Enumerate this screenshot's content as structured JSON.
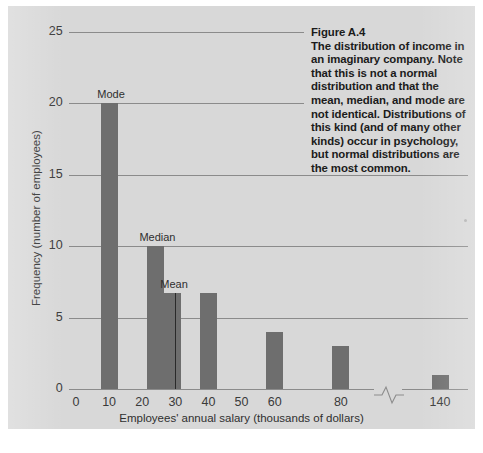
{
  "figure": {
    "caption_title": "Figure A.4",
    "caption_body": "The distribution of income in an imaginary company. Note that this is not a normal distribution and that the mean, median, and mode are not identical. Distributions of this kind (and of many other kinds) occur in psychology, but normal distributions are the most common."
  },
  "colors": {
    "panel_background": "#d8d8d8",
    "bar_fill": "#6e6e6e",
    "gridline": "#8b8b8b",
    "text": "#2f2f2f",
    "caption_text": "#1b1b1b"
  },
  "chart_data": {
    "type": "bar",
    "title": "",
    "xlabel": "Employees' annual salary (thousands of dollars)",
    "ylabel": "Frequency (number of employees)",
    "xlim": [
      0,
      150
    ],
    "ylim": [
      0,
      25
    ],
    "yticks": [
      0,
      5,
      10,
      15,
      20,
      25
    ],
    "xticks": [
      0,
      10,
      20,
      30,
      40,
      50,
      60,
      80,
      140
    ],
    "xtick_labels": [
      "0",
      "10",
      "20",
      "30",
      "40",
      "50",
      "60",
      "80",
      "140"
    ],
    "ytick_labels": [
      "0",
      "5",
      "10",
      "15",
      "20",
      "25"
    ],
    "grid": true,
    "legend": "none",
    "axis_break": {
      "between": [
        80,
        140
      ],
      "style": "zigzag"
    },
    "categories": [
      "10",
      "24",
      "29",
      "40",
      "60",
      "80",
      "140"
    ],
    "values": [
      20,
      10,
      6.7,
      6.7,
      4,
      3,
      1
    ],
    "annotations": [
      {
        "label": "Mode",
        "at_category": "10",
        "value": 20
      },
      {
        "label": "Median",
        "at_category": "24",
        "value": 10
      },
      {
        "label": "Mean",
        "at_category": "29",
        "value": 6.7
      }
    ]
  }
}
